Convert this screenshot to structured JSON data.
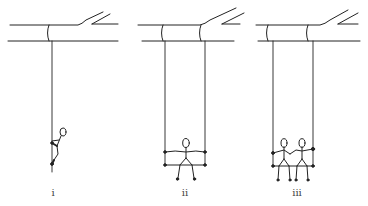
{
  "figure": {
    "ink_color": "#222222",
    "panels": [
      {
        "label": "i",
        "type": "single-rope swing",
        "riders": 1,
        "rider_pose": "climbing / hanging on rope"
      },
      {
        "label": "ii",
        "type": "two-rope seat swing",
        "riders": 1,
        "rider_pose": "seated, arms outstretched holding ropes"
      },
      {
        "label": "iii",
        "type": "two-rope seat swing",
        "riders": 2,
        "rider_pose": "two seated figures holding hands and ropes"
      }
    ]
  }
}
